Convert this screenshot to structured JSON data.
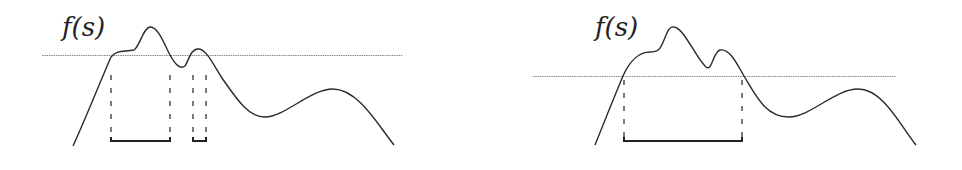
{
  "figure": {
    "type": "diagram",
    "panels": [
      {
        "id": "left",
        "label": "f(s)",
        "threshold_label": "high threshold",
        "interval_count": 2,
        "intervals": [
          {
            "start_x": 111,
            "end_x": 170
          },
          {
            "start_x": 193,
            "end_x": 206
          }
        ]
      },
      {
        "id": "right",
        "label": "f(s)",
        "threshold_label": "low threshold",
        "interval_count": 1,
        "intervals": [
          {
            "start_x": 624,
            "end_x": 742
          }
        ]
      }
    ]
  },
  "colors": {
    "curve": "#2a2a2a",
    "threshold": "#888888",
    "dash": "#333333",
    "bracket": "#222222"
  }
}
